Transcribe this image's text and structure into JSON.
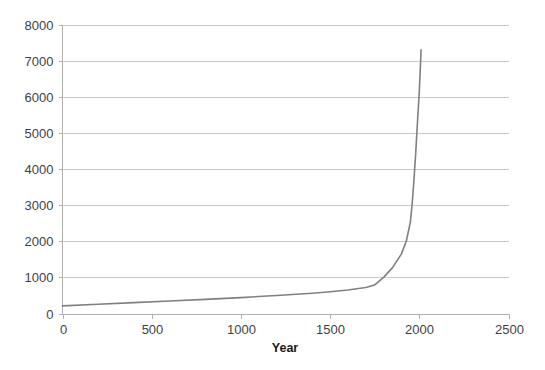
{
  "chart_data": {
    "type": "line",
    "title": "",
    "subtitle": "",
    "xlabel": "Year",
    "ylabel": "",
    "xlim": [
      0,
      2500
    ],
    "ylim": [
      0,
      8000
    ],
    "xticks": [
      0,
      500,
      1000,
      1500,
      2000,
      2500
    ],
    "yticks": [
      0,
      1000,
      2000,
      3000,
      4000,
      5000,
      6000,
      7000,
      8000
    ],
    "xtick_labels": [
      "0",
      "500",
      "1000",
      "1500",
      "2000",
      "2500"
    ],
    "ytick_labels": [
      "0",
      "1000",
      "2000",
      "3000",
      "4000",
      "5000",
      "6000",
      "7000",
      "8000"
    ],
    "grid": {
      "horizontal": true,
      "vertical": false,
      "color": "#c9c9c9"
    },
    "legend": {
      "visible": false,
      "position": "none",
      "entries": []
    },
    "annotations": [],
    "series": [
      {
        "name": "Population",
        "color": "#808080",
        "line_width": 1.6,
        "markers": false,
        "x": [
          0,
          200,
          400,
          600,
          800,
          1000,
          1200,
          1400,
          1500,
          1600,
          1700,
          1750,
          1800,
          1850,
          1900,
          1927,
          1950,
          1960,
          1970,
          1980,
          1990,
          2000,
          2010
        ],
        "y": [
          210,
          255,
          300,
          345,
          390,
          440,
          500,
          560,
          600,
          650,
          720,
          790,
          1000,
          1270,
          1650,
          2000,
          2530,
          3030,
          3700,
          4450,
          5320,
          6140,
          7300
        ]
      }
    ]
  },
  "axes": {
    "y_axis_label_color": "#3f3f3f",
    "x_axis_label_color": "#3f3f3f",
    "axis_line_color": "#b0b0b0"
  },
  "canvas": {
    "background": "#ffffff",
    "width": 545,
    "height": 370
  }
}
